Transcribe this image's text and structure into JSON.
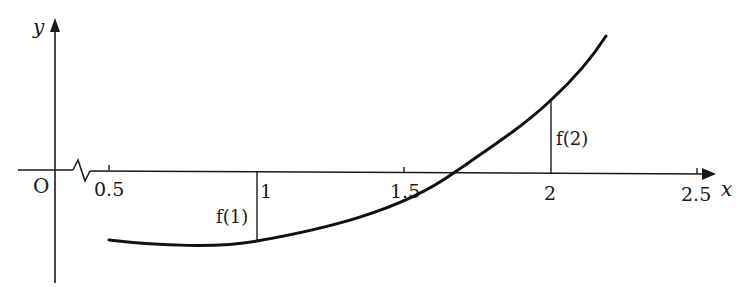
{
  "figure": {
    "type": "function-graph",
    "axes": {
      "x_label": "x",
      "y_label": "y",
      "origin_label": "O",
      "x_axis_break": true,
      "x_ticks": [
        {
          "value": 0.5,
          "label": "0.5"
        },
        {
          "value": 1,
          "label": "1"
        },
        {
          "value": 1.5,
          "label": "1.5"
        },
        {
          "value": 2,
          "label": "2"
        },
        {
          "value": 2.5,
          "label": "2.5"
        }
      ]
    },
    "curve": {
      "description": "increasing convex curve, negative near x=1, crossing x-axis between 1.5 and 2, positive at x=2",
      "x_start": 0.5,
      "x_end": 2.2,
      "root_approx": 1.67
    },
    "markers": [
      {
        "x": 1,
        "label": "f(1)",
        "sign": "negative"
      },
      {
        "x": 2,
        "label": "f(2)",
        "sign": "positive"
      }
    ],
    "colors": {
      "stroke": "#1a1a1a",
      "background": "#ffffff"
    }
  }
}
